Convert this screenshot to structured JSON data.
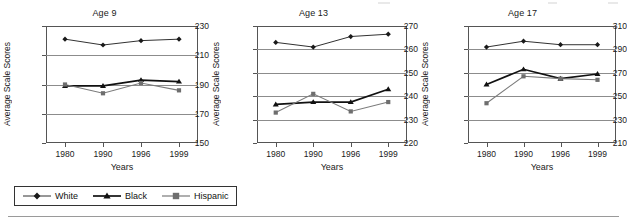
{
  "figure": {
    "series_names": [
      "White",
      "Black",
      "Hispanic"
    ],
    "legend": {
      "items": [
        {
          "label": "White",
          "marker": "diamond-marker-icon",
          "color": "#1a1a1a"
        },
        {
          "label": "Black",
          "marker": "triangle-marker-icon",
          "color": "#111111"
        },
        {
          "label": "Hispanic",
          "marker": "square-marker-icon",
          "color": "#6e6e6e"
        }
      ]
    }
  },
  "chart_data": [
    {
      "type": "line",
      "title": "Age 9",
      "xlabel": "Years",
      "ylabel": "Average Scale Scores",
      "categories": [
        "1980",
        "1990",
        "1996",
        "1999"
      ],
      "ylim": [
        150,
        230
      ],
      "yticks": [
        150,
        170,
        190,
        210,
        230
      ],
      "grid": true,
      "legend_position": "bottom",
      "series": [
        {
          "name": "White",
          "values": [
            221,
            217,
            220,
            221
          ]
        },
        {
          "name": "Black",
          "values": [
            189,
            189,
            193,
            192
          ]
        },
        {
          "name": "Hispanic",
          "values": [
            190,
            184,
            191,
            186
          ]
        }
      ]
    },
    {
      "type": "line",
      "title": "Age 13",
      "xlabel": "Years",
      "ylabel": "Average Scale Scores",
      "categories": [
        "1980",
        "1990",
        "1996",
        "1999"
      ],
      "ylim": [
        220,
        270
      ],
      "yticks": [
        220,
        230,
        240,
        250,
        260,
        270
      ],
      "grid": true,
      "legend_position": "bottom",
      "series": [
        {
          "name": "White",
          "values": [
            263,
            261,
            265.5,
            266.5
          ]
        },
        {
          "name": "Black",
          "values": [
            236.5,
            237.5,
            237.5,
            243
          ]
        },
        {
          "name": "Hispanic",
          "values": [
            233,
            241,
            233.5,
            237.5
          ]
        }
      ]
    },
    {
      "type": "line",
      "title": "Age 17",
      "xlabel": "Years",
      "ylabel": "Average Scale Scores",
      "categories": [
        "1980",
        "1990",
        "1996",
        "1999"
      ],
      "ylim": [
        210,
        310
      ],
      "yticks": [
        210,
        230,
        250,
        270,
        290,
        310
      ],
      "grid": true,
      "legend_position": "bottom",
      "series": [
        {
          "name": "White",
          "values": [
            292,
            297,
            294,
            294
          ]
        },
        {
          "name": "Black",
          "values": [
            260,
            273,
            265,
            269
          ]
        },
        {
          "name": "Hispanic",
          "values": [
            244,
            267,
            265,
            264
          ]
        }
      ]
    }
  ]
}
